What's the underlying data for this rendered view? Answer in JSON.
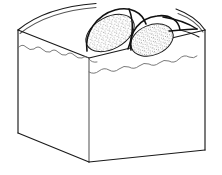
{
  "figure": {
    "kind": "line-art-illustration",
    "caption": "",
    "labels": [],
    "text_present": false,
    "background_color": "#ffffff",
    "line_color": "#1a1a1a",
    "secondary_line_color": "#6b6b6b",
    "stipple_color": "#222222",
    "canvas": {
      "width": 222,
      "height": 175
    }
  },
  "block": {
    "name": "rectangular-block",
    "description": "Three-quarter view of a rectangular solid block showing top surface, front-left face and front-right face",
    "top_surface": {
      "name": "top-surface",
      "corner_left": [
        18,
        30
      ],
      "corner_front": [
        89,
        58
      ],
      "corner_right": [
        205,
        30
      ],
      "back_edge_curved": true
    },
    "front_left_face": {
      "name": "front-left-face",
      "vertices": [
        [
          18,
          30
        ],
        [
          89,
          58
        ],
        [
          89,
          162
        ],
        [
          18,
          133
        ]
      ]
    },
    "front_right_face": {
      "name": "front-right-face",
      "vertices": [
        [
          89,
          58
        ],
        [
          205,
          30
        ],
        [
          205,
          150
        ],
        [
          89,
          162
        ]
      ]
    },
    "vertical_edges": {
      "left_edge": [
        [
          18,
          30
        ],
        [
          18,
          133
        ]
      ],
      "center_edge": [
        [
          89,
          58
        ],
        [
          89,
          162
        ]
      ],
      "right_edge": [
        [
          205,
          30
        ],
        [
          205,
          150
        ]
      ]
    },
    "surface_layer_line": {
      "name": "wavy-surface-boundary",
      "style": "irregular wavy line",
      "description": "Wavy horizontal boundary a short distance below the top edge on both front faces, indicating a surface or soil layer"
    }
  },
  "mounds": [
    {
      "name": "left-mound",
      "shape": "elongated oblique dome",
      "texture": "stippled",
      "center": [
        110,
        33
      ],
      "rx": 26,
      "ry": 16,
      "rotation_deg": -28
    },
    {
      "name": "right-mound",
      "shape": "rounded oval dome",
      "texture": "stippled",
      "center": [
        152,
        40
      ],
      "rx": 22,
      "ry": 15,
      "rotation_deg": -22
    }
  ],
  "ridge": {
    "name": "tapering-ridge",
    "description": "Narrow pointed ridge extending from the right mound toward the right rear corner of the block"
  }
}
